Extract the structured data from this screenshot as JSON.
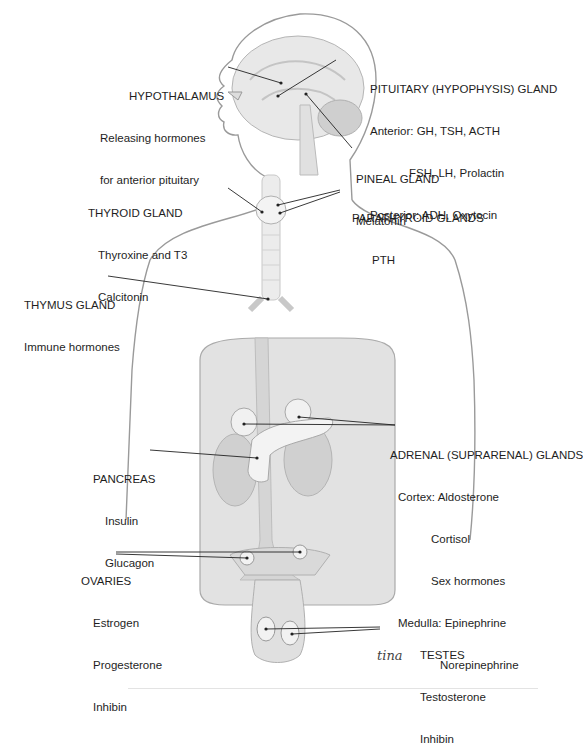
{
  "figure": {
    "labels": {
      "hypothalamus": {
        "title": "HYPOTHALAMUS",
        "lines": [
          "Releasing hormones",
          "for anterior pituitary"
        ]
      },
      "pituitary": {
        "title": "PITUITARY (HYPOPHYSIS) GLAND",
        "lines": [
          "Anterior: GH, TSH, ACTH",
          "FSH, LH, Prolactin",
          "Posterior: ADH, Oxytocin"
        ]
      },
      "pineal": {
        "title": "PINEAL GLAND",
        "lines": [
          "Melatonin"
        ]
      },
      "thyroid": {
        "title": "THYROID GLAND",
        "lines": [
          "Thyroxine and T3",
          "Calcitonin"
        ]
      },
      "parathyroid": {
        "title": "PARATHYROID GLANDS",
        "lines": [
          "PTH"
        ]
      },
      "thymus": {
        "title": "THYMUS GLAND",
        "lines": [
          "Immune hormones"
        ]
      },
      "adrenal": {
        "title": "ADRENAL (SUPRARENAL) GLANDS",
        "lines": [
          "Cortex: Aldosterone",
          "Cortisol",
          "Sex hormones",
          "Medulla: Epinephrine",
          "Norepinephrine"
        ]
      },
      "pancreas": {
        "title": "PANCREAS",
        "lines": [
          "Insulin",
          "Glucagon"
        ]
      },
      "ovaries": {
        "title": "OVARIES",
        "lines": [
          "Estrogen",
          "Progesterone",
          "Inhibin"
        ]
      },
      "testes": {
        "title": "TESTES",
        "lines": [
          "Testosterone",
          "Inhibin"
        ]
      }
    },
    "signature": "tina",
    "colors": {
      "outline": "#9a9a9a",
      "fill": "#e6e6e6",
      "organ": "#d4d4d4",
      "gland": "#f2f2f2",
      "leader": "#222222"
    }
  }
}
